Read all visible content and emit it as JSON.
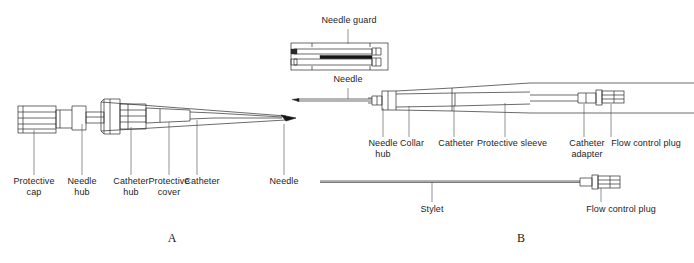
{
  "figure": {
    "type": "line-drawing-technical-diagram",
    "ink_color": "#111111",
    "line_color": "#333333",
    "background": "#ffffff"
  },
  "panels": [
    {
      "id": "A",
      "id_label": "A",
      "id_pos": {
        "x": 172,
        "y": 238
      },
      "labels": [
        {
          "name": "protective-cap",
          "text": "Protective\ncap",
          "x": 34,
          "y": 178,
          "leader_x": 34,
          "leader_y1": 130,
          "leader_y2": 175
        },
        {
          "name": "needle-hub",
          "text": "Needle\nhub",
          "x": 82,
          "y": 178,
          "leader_x": 82,
          "leader_y1": 124,
          "leader_y2": 175
        },
        {
          "name": "catheter-hub",
          "text": "Catheter\nhub",
          "x": 131,
          "y": 178,
          "leader_x": 131,
          "leader_y1": 127,
          "leader_y2": 175
        },
        {
          "name": "protective-cover",
          "text": "Protective\ncover",
          "x": 169,
          "y": 178,
          "leader_x": 169,
          "leader_y1": 122,
          "leader_y2": 175
        },
        {
          "name": "catheter",
          "text": "Catheter",
          "x": 202,
          "y": 178,
          "leader_x": 197,
          "leader_y1": 120,
          "leader_y2": 175
        },
        {
          "name": "needle",
          "text": "Needle",
          "x": 284,
          "y": 178,
          "leader_x": 284,
          "leader_y1": 124,
          "leader_y2": 175
        }
      ]
    },
    {
      "id": "B",
      "id_label": "B",
      "id_pos": {
        "x": 521,
        "y": 238
      },
      "labels": [
        {
          "name": "needle-guard",
          "text": "Needle guard",
          "x": 354,
          "y": 17,
          "leader_x": 348,
          "leader_y1": 29,
          "leader_y2": 44
        },
        {
          "name": "needle",
          "text": "Needle",
          "x": 348,
          "y": 76,
          "leader_x": 348,
          "leader_y1": 71,
          "leader_y2": 74
        },
        {
          "name": "needle-hub",
          "text": "Needle\nhub",
          "x": 383,
          "y": 140,
          "leader_x": 383,
          "leader_y1": 112,
          "leader_y2": 137
        },
        {
          "name": "collar",
          "text": "Collar",
          "x": 412,
          "y": 140,
          "leader_x": 409,
          "leader_y1": 107,
          "leader_y2": 137
        },
        {
          "name": "catheter",
          "text": "Catheter",
          "x": 456,
          "y": 140,
          "leader_x": 454,
          "leader_y1": 107,
          "leader_y2": 137
        },
        {
          "name": "protective-sleeve",
          "text": "Protective sleeve",
          "x": 512,
          "y": 140,
          "leader_x": 505,
          "leader_y1": 107,
          "leader_y2": 137
        },
        {
          "name": "catheter-adapter",
          "text": "Catheter\nadapter",
          "x": 586,
          "y": 140,
          "leader_x": 584,
          "leader_y1": 104,
          "leader_y2": 137
        },
        {
          "name": "flow-control-plug",
          "text": "Flow control plug",
          "x": 645,
          "y": 140,
          "leader_x": 611,
          "leader_y1": 104,
          "leader_y2": 137
        },
        {
          "name": "stylet",
          "text": "Stylet",
          "x": 432,
          "y": 206,
          "leader_x": 432,
          "leader_y1": 181,
          "leader_y2": 202
        },
        {
          "name": "flow-control-plug-stylet",
          "text": "Flow control plug",
          "x": 621,
          "y": 206,
          "leader_x": 601,
          "leader_y1": 184,
          "leader_y2": 202
        }
      ]
    }
  ],
  "components": {
    "panel_a": [
      "protective cap",
      "needle hub",
      "catheter hub",
      "protective cover",
      "catheter",
      "needle"
    ],
    "panel_b": [
      "needle guard",
      "needle",
      "needle hub",
      "collar",
      "catheter",
      "protective sleeve",
      "catheter adapter",
      "flow control plug",
      "stylet"
    ]
  }
}
